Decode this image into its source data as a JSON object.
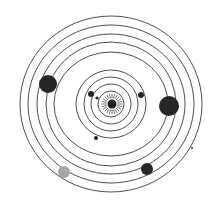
{
  "diagram": {
    "title": "Solar system orbit diagram",
    "center": {
      "x": 111,
      "y": 104
    },
    "colors": {
      "orbit": "#3a3a3a",
      "planet_dark": "#262626",
      "planet_gray": "#a6a6a6",
      "sun": "#1f1f1f",
      "background": "#ffffff"
    },
    "sun": {
      "x": 112,
      "y": 104,
      "r": 4.5,
      "ray_inner": 6,
      "ray_outer": 10,
      "ray_count": 24
    },
    "orbits": [
      {
        "rx": 13,
        "ry": 13
      },
      {
        "rx": 20,
        "ry": 20
      },
      {
        "rx": 27,
        "ry": 27
      },
      {
        "rx": 35,
        "ry": 34
      },
      {
        "rx": 57,
        "ry": 52
      },
      {
        "rx": 65,
        "ry": 62
      },
      {
        "rx": 74,
        "ry": 70
      },
      {
        "rx": 83,
        "ry": 79
      },
      {
        "rx": 91,
        "ry": 88
      }
    ],
    "planets": [
      {
        "name": "planet-inner-small",
        "x": 97,
        "y": 98,
        "r": 1.6,
        "color": "#262626"
      },
      {
        "name": "planet-inner-left",
        "x": 91,
        "y": 94,
        "r": 3,
        "color": "#262626"
      },
      {
        "name": "planet-inner-right",
        "x": 141,
        "y": 95,
        "r": 3,
        "color": "#262626"
      },
      {
        "name": "planet-inner-bottom",
        "x": 96,
        "y": 138,
        "r": 2,
        "color": "#262626"
      },
      {
        "name": "planet-large-left",
        "x": 48,
        "y": 84,
        "r": 9,
        "color": "#262626"
      },
      {
        "name": "planet-large-right",
        "x": 169,
        "y": 106,
        "r": 10,
        "color": "#262626"
      },
      {
        "name": "planet-gray",
        "x": 64,
        "y": 172,
        "r": 6,
        "color": "#a6a6a6"
      },
      {
        "name": "planet-dark-bottom",
        "x": 147,
        "y": 169,
        "r": 6,
        "color": "#262626"
      },
      {
        "name": "planet-tiny-right",
        "x": 192,
        "y": 148,
        "r": 1,
        "color": "#333333"
      }
    ]
  }
}
